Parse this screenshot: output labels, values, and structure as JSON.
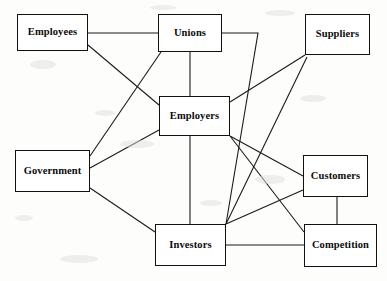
{
  "diagram": {
    "type": "node-link-network",
    "canvas": {
      "width": 387,
      "height": 281
    },
    "style": {
      "node_fill": "#ffffff",
      "node_stroke": "#111111",
      "edge_stroke": "#1a1a1a",
      "background": "#fdfdfc",
      "node_stroke_width": 1.6,
      "edge_stroke_width": 1.1
    },
    "nodes": [
      {
        "id": "employees",
        "label": "Employees",
        "x": 17,
        "y": 14,
        "w": 71,
        "h": 37
      },
      {
        "id": "unions",
        "label": "Unions",
        "x": 158,
        "y": 14,
        "w": 64,
        "h": 38
      },
      {
        "id": "suppliers",
        "label": "Suppliers",
        "x": 305,
        "y": 14,
        "w": 65,
        "h": 41
      },
      {
        "id": "employers",
        "label": "Employers",
        "x": 159,
        "y": 96,
        "w": 71,
        "h": 40
      },
      {
        "id": "government",
        "label": "Government",
        "x": 15,
        "y": 150,
        "w": 75,
        "h": 42
      },
      {
        "id": "customers",
        "label": "Customers",
        "x": 303,
        "y": 155,
        "w": 65,
        "h": 42
      },
      {
        "id": "investors",
        "label": "Investors",
        "x": 155,
        "y": 224,
        "w": 71,
        "h": 42
      },
      {
        "id": "competition",
        "label": "Competition",
        "x": 304,
        "y": 224,
        "w": 73,
        "h": 43
      }
    ],
    "edges": [
      {
        "from": "employees",
        "to": "unions",
        "path": "M 88,33 L 158,33"
      },
      {
        "from": "employees",
        "to": "employers",
        "path": "M 88,45 L 159,105"
      },
      {
        "from": "unions",
        "to": "employers",
        "path": "M 190,52 L 190,96"
      },
      {
        "from": "unions",
        "to": "government",
        "path": "M 161,52 L 90,156"
      },
      {
        "from": "unions",
        "to": "investors",
        "path": "M 222,33 L 258,33 L 226,224"
      },
      {
        "from": "suppliers",
        "to": "employers",
        "path": "M 305,55 L 230,102"
      },
      {
        "from": "suppliers",
        "to": "investors",
        "path": "M 307,57 L 226,224"
      },
      {
        "from": "employers",
        "to": "government",
        "path": "M 159,130 L 90,168"
      },
      {
        "from": "employers",
        "to": "investors",
        "path": "M 190,136 L 190,224"
      },
      {
        "from": "employers",
        "to": "customers",
        "path": "M 230,136 L 303,176"
      },
      {
        "from": "employers",
        "to": "competition",
        "path": "M 230,136 L 304,232"
      },
      {
        "from": "government",
        "to": "investors",
        "path": "M 90,188 L 155,232"
      },
      {
        "from": "customers",
        "to": "investors",
        "path": "M 303,190 L 226,224"
      },
      {
        "from": "customers",
        "to": "competition",
        "path": "M 337,197 L 337,224"
      },
      {
        "from": "investors",
        "to": "competition",
        "path": "M 226,245 L 304,245"
      }
    ]
  }
}
